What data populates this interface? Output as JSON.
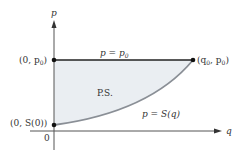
{
  "diagram": {
    "axis_labels": {
      "y": "p",
      "x": "q",
      "origin": "0"
    },
    "points": {
      "top_left": "(0, p",
      "top_left_sub": "0",
      "top_right": "(q",
      "top_right_sub": "0",
      "top_right_mid": ", p",
      "top_right_sub2": "0",
      "bottom_left": "(0, S(0))"
    },
    "line_label": "p = p",
    "line_label_sub": "0",
    "region_label": "P.S.",
    "curve_label": "p = S(q)",
    "colors": {
      "fill": "#eaeef2",
      "curve": "#8a8f96",
      "line": "#222222"
    }
  }
}
